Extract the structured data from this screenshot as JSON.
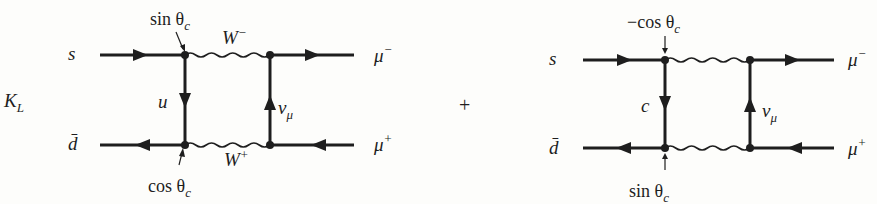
{
  "diagram": {
    "system_label": {
      "main": "K",
      "sub": "L"
    },
    "operator": "+",
    "diagrams": [
      {
        "id": "up-quark-box",
        "incoming_top": "s",
        "incoming_bottom": "d̄",
        "outgoing_top": {
          "main": "μ",
          "sup": "−"
        },
        "outgoing_bottom": {
          "main": "μ",
          "sup": "+"
        },
        "internal_quark": "u",
        "internal_lepton": {
          "main": "ν",
          "sub": "μ"
        },
        "boson_top": {
          "main": "W",
          "sup": "−"
        },
        "boson_bottom": {
          "main": "W",
          "sup": "+"
        },
        "coupling_top": {
          "text": "sin θ",
          "sub": "c"
        },
        "coupling_bottom": {
          "text": "cos θ",
          "sub": "c"
        }
      },
      {
        "id": "charm-quark-box",
        "incoming_top": "s",
        "incoming_bottom": "d̄",
        "outgoing_top": {
          "main": "μ",
          "sup": "−"
        },
        "outgoing_bottom": {
          "main": "μ",
          "sup": "+"
        },
        "internal_quark": "c",
        "internal_lepton": {
          "main": "ν",
          "sub": "μ"
        },
        "coupling_top": {
          "text": "−cos θ",
          "sub": "c"
        },
        "coupling_bottom": {
          "text": "sin θ",
          "sub": "c"
        }
      }
    ]
  }
}
